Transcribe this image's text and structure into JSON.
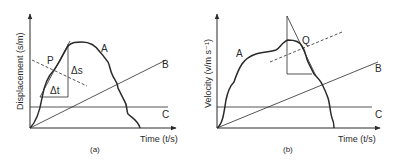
{
  "figure": {
    "panels": [
      {
        "id": "a",
        "caption": "(a)",
        "y_axis_label": "Displacement (s/m)",
        "x_axis_label": "Time (t/s)",
        "curves": {
          "A": "A",
          "B": "B",
          "C": "C"
        },
        "point_label": "P",
        "delta_y_label": "Δs",
        "delta_x_label": "Δt"
      },
      {
        "id": "b",
        "caption": "(b)",
        "y_axis_label": "Velocity (v/m s⁻¹)",
        "x_axis_label": "Time (t/s)",
        "curves": {
          "A": "A",
          "B": "B",
          "C": "C"
        },
        "point_label": "Q"
      }
    ]
  },
  "colors": {
    "ink": "#2a2a2a",
    "background": "#ffffff"
  }
}
